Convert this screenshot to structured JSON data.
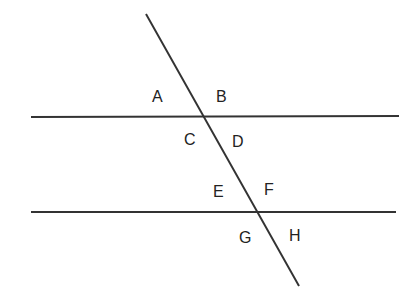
{
  "diagram": {
    "type": "parallel-lines-transversal",
    "colors": {
      "line": "#333333",
      "text": "#222222",
      "background": "#ffffff"
    },
    "lines": [
      {
        "id": "parallel-top",
        "x1": 31,
        "y1": 117,
        "x2": 399,
        "y2": 116
      },
      {
        "id": "parallel-bottom",
        "x1": 31,
        "y1": 212,
        "x2": 396,
        "y2": 212
      },
      {
        "id": "transversal",
        "x1": 146,
        "y1": 14,
        "x2": 299,
        "y2": 286
      }
    ],
    "labels": [
      {
        "id": "A",
        "text": "A",
        "x": 152,
        "y": 102
      },
      {
        "id": "B",
        "text": "B",
        "x": 216,
        "y": 102
      },
      {
        "id": "C",
        "text": "C",
        "x": 184,
        "y": 145
      },
      {
        "id": "D",
        "text": "D",
        "x": 232,
        "y": 147
      },
      {
        "id": "E",
        "text": "E",
        "x": 213,
        "y": 197
      },
      {
        "id": "F",
        "text": "F",
        "x": 264,
        "y": 195
      },
      {
        "id": "G",
        "text": "G",
        "x": 239,
        "y": 243
      },
      {
        "id": "H",
        "text": "H",
        "x": 289,
        "y": 241
      }
    ]
  }
}
